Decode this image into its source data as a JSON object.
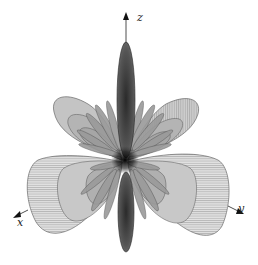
{
  "figure": {
    "axes": {
      "z": {
        "label": "z"
      },
      "x": {
        "label": "x"
      },
      "y": {
        "label": "y"
      }
    },
    "colors": {
      "background": "#ffffff",
      "main_lobe": "#3a3a3a",
      "side_lobe_fill": "#bdbdbd",
      "outline": "#555555",
      "axis": "#222222"
    }
  }
}
